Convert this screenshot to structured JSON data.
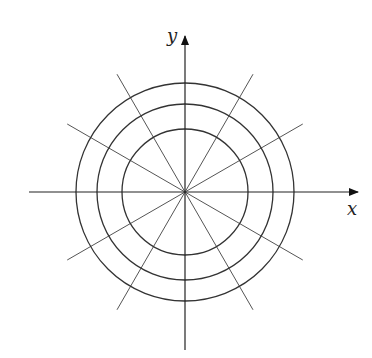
{
  "diagram": {
    "axes": {
      "x_label": "x",
      "y_label": "y"
    },
    "center": [
      185,
      192
    ],
    "circle_radii": [
      63,
      88,
      109
    ],
    "ray_angles_deg": [
      30,
      60,
      120,
      150
    ],
    "ray_half_length": 136,
    "colors": {
      "line": "#333333",
      "ray": "#555555",
      "background": "#ffffff"
    }
  }
}
